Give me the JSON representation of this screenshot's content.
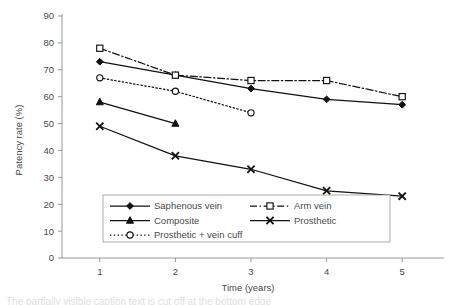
{
  "figure": {
    "caption_fragment": "The partially visible caption text is cut off at the bottom edge"
  },
  "chart_data": {
    "type": "line",
    "title": "",
    "xlabel": "Time (years)",
    "ylabel": "Patency rate (%)",
    "x": [
      1,
      2,
      3,
      4,
      5
    ],
    "xticklabels": [
      "1",
      "2",
      "3",
      "4",
      "5"
    ],
    "xlim": [
      0.5,
      5.5
    ],
    "ylim": [
      0,
      90
    ],
    "yticks": [
      0,
      10,
      20,
      30,
      40,
      50,
      60,
      70,
      80,
      90
    ],
    "yticklabels": [
      "0",
      "10",
      "20",
      "30",
      "40",
      "50",
      "60",
      "70",
      "80",
      "90"
    ],
    "grid": false,
    "legend_position": "lower-center",
    "series": [
      {
        "name": "Saphenous vein",
        "marker": "filled-diamond",
        "linestyle": "solid",
        "x": [
          1,
          2,
          3,
          4,
          5
        ],
        "values": [
          73,
          68,
          63,
          59,
          57
        ]
      },
      {
        "name": "Arm vein",
        "marker": "open-square",
        "linestyle": "dash-dot",
        "x": [
          1,
          2,
          3,
          4,
          5
        ],
        "values": [
          78,
          68,
          66,
          66,
          60
        ]
      },
      {
        "name": "Composite",
        "marker": "filled-triangle",
        "linestyle": "solid",
        "x": [
          1,
          2
        ],
        "values": [
          58,
          50
        ]
      },
      {
        "name": "Prosthetic",
        "marker": "cross-x",
        "linestyle": "solid",
        "x": [
          1,
          2,
          3,
          4,
          5
        ],
        "values": [
          49,
          38,
          33,
          25,
          23
        ]
      },
      {
        "name": "Prosthetic + vein cuff",
        "marker": "open-circle",
        "linestyle": "dotted",
        "x": [
          1,
          2,
          3
        ],
        "values": [
          67,
          62,
          54
        ]
      }
    ]
  },
  "colors": {
    "ink": "#111111",
    "axis": "#8d8d8d",
    "text": "#4a4a4a",
    "background": "#ffffff"
  }
}
